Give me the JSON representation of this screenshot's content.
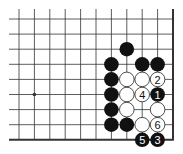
{
  "diagram": {
    "type": "go-board-corner",
    "grid": {
      "columns": 11,
      "rows": 9,
      "x_start": 19,
      "y_start": 19,
      "spacing_x": 15.4,
      "spacing_y": 15.1,
      "right_edge": true,
      "bottom_edge": true
    },
    "colors": {
      "line": "#333333",
      "black_stone": "#111111",
      "white_stone": "#ffffff",
      "white_stroke": "#222222"
    },
    "star_points": [
      {
        "col": 1,
        "row": 5
      }
    ],
    "stones": [
      {
        "col": 7,
        "row": 2,
        "color": "black",
        "label": ""
      },
      {
        "col": 6,
        "row": 3,
        "color": "black",
        "label": ""
      },
      {
        "col": 8,
        "row": 3,
        "color": "black",
        "label": ""
      },
      {
        "col": 9,
        "row": 3,
        "color": "black",
        "label": ""
      },
      {
        "col": 6,
        "row": 4,
        "color": "black",
        "label": ""
      },
      {
        "col": 7,
        "row": 4,
        "color": "white",
        "label": ""
      },
      {
        "col": 8,
        "row": 4,
        "color": "white",
        "label": ""
      },
      {
        "col": 9,
        "row": 4,
        "color": "white",
        "label": "2"
      },
      {
        "col": 6,
        "row": 5,
        "color": "black",
        "label": ""
      },
      {
        "col": 7,
        "row": 5,
        "color": "white",
        "label": ""
      },
      {
        "col": 8,
        "row": 5,
        "color": "white",
        "label": "4"
      },
      {
        "col": 9,
        "row": 5,
        "color": "black",
        "label": "1"
      },
      {
        "col": 6,
        "row": 6,
        "color": "black",
        "label": ""
      },
      {
        "col": 7,
        "row": 6,
        "color": "white",
        "label": ""
      },
      {
        "col": 9,
        "row": 6,
        "color": "white",
        "label": ""
      },
      {
        "col": 6,
        "row": 7,
        "color": "black",
        "label": ""
      },
      {
        "col": 7,
        "row": 7,
        "color": "black",
        "label": ""
      },
      {
        "col": 8,
        "row": 7,
        "color": "white",
        "label": ""
      },
      {
        "col": 9,
        "row": 7,
        "color": "white",
        "label": "6"
      },
      {
        "col": 8,
        "row": 8,
        "color": "black",
        "label": "5"
      },
      {
        "col": 9,
        "row": 8,
        "color": "black",
        "label": "3"
      }
    ]
  }
}
